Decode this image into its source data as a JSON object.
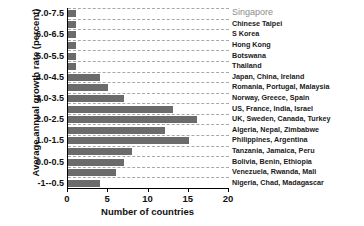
{
  "chart_data": {
    "type": "bar",
    "orientation": "horizontal",
    "title": "",
    "xlabel": "Number of countries",
    "ylabel": "Average annual growth rate (percent)",
    "xlim": [
      0,
      20
    ],
    "xticks": [
      0,
      5,
      10,
      15,
      20
    ],
    "xtick_labels": [
      "0",
      "5",
      "10",
      "15",
      "20"
    ],
    "grid": "horizontal-dashed",
    "legend": "none",
    "categories": [
      "7.0-7.5",
      "6.5-7.0",
      "6.0-6.5",
      "5.5-6.0",
      "5.0-5.5",
      "4.5-5.0",
      "4.0-4.5",
      "3.5-4.0",
      "3.0-3.5",
      "2.5-3.0",
      "2.0-2.5",
      "1.5-2.0",
      "1.0-1.5",
      "0.5-1.0",
      "0.0-0.5",
      "-0.5-0.0",
      "-1--0.5"
    ],
    "visible_ytick_labels": [
      "7.0-7.5",
      "6.0-6.5",
      "5.0-5.5",
      "4.0-4.5",
      "3.0-3.5",
      "2.0-2.5",
      "1.0-1.5",
      "0.0-0.5",
      "-1--0.5"
    ],
    "values": [
      1,
      1,
      1,
      1,
      1,
      1,
      4,
      5,
      7,
      13,
      16,
      12,
      15,
      8,
      7,
      6,
      4
    ],
    "annotations": [
      "Singapore",
      "Chinese Taipei",
      "S Korea",
      "Hong Kong",
      "Botswana",
      "Thailand",
      "Japan, China, Ireland",
      "Romania, Portugal, Malaysia",
      "Norway, Greece, Spain",
      "US, France, India, Israel",
      "UK, Sweden, Canada, Turkey",
      "Algeria, Nepal, Zimbabwe",
      "Philippines, Argentina",
      "Tanzania, Jamaica, Peru",
      "Bolivia, Benin, Ethiopia",
      "Venezuela, Rwanda, Mali",
      "Nigeria, Chad, Madagascar"
    ],
    "colors": {
      "bar": "#6b6b6b",
      "grid": "#8c8c8c",
      "axis": "#000000",
      "text": "#111111",
      "annotation": "#1a1a1a",
      "annotation_highlight": "#8d8d8d",
      "background": "#ffffff"
    }
  }
}
